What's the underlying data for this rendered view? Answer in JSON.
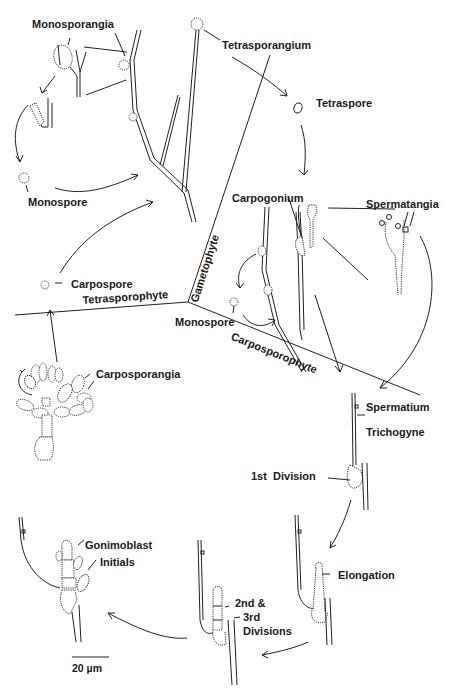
{
  "diagram": {
    "regions": {
      "gametophyte": "Gametophyte",
      "tetrasporophyte": "Tetrasporophyte",
      "carposporophyte": "Carposporophyte"
    },
    "labels": {
      "monosporangia": "Monosporangia",
      "monospore_left": "Monospore",
      "tetrasporangium": "Tetrasporangium",
      "tetraspore": "Tetraspore",
      "carpogonium": "Carpogonium",
      "spermatangia": "Spermatangia",
      "carpospore": "Carpospore",
      "monospore_center": "Monospore",
      "carposporangia": "Carposporangia",
      "spermatium": "Spermatium",
      "trichogyne": "Trichogyne",
      "first_division": "1st  Division",
      "elongation": "Elongation",
      "gonimoblast_line1": "Gonimoblast",
      "gonimoblast_line2": "Initials",
      "divisions_line1": "2nd &",
      "divisions_line2": "3rd",
      "divisions_line3": "Divisions"
    },
    "scale_bar": {
      "label": "20 µm"
    },
    "colors": {
      "ink": "#222222",
      "background": "#ffffff"
    }
  }
}
